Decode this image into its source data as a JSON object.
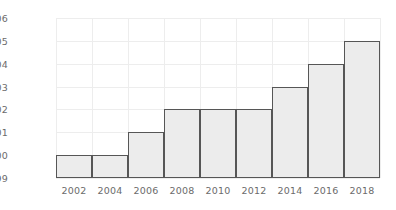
{
  "chart_data": {
    "type": "bar",
    "title": "",
    "subtitle": "",
    "xlabel": "",
    "ylabel": "",
    "categories": [
      "2002",
      "2004",
      "2006",
      "2008",
      "2010",
      "2012",
      "2014",
      "2016",
      "2018"
    ],
    "values": [
      10000,
      10000,
      10001,
      10002,
      10002,
      10002,
      10003,
      10004,
      10005
    ],
    "series": [
      {
        "name": "",
        "values": [
          10000,
          10000,
          10001,
          10002,
          10002,
          10002,
          10003,
          10004,
          10005
        ]
      }
    ],
    "ylim": [
      9999,
      10006
    ],
    "y_ticks": [
      9999,
      10000,
      10001,
      10002,
      10003,
      10004,
      10005,
      10006
    ],
    "y_tick_labels": [
      "9999",
      "10000",
      "10001",
      "10002",
      "10003",
      "10004",
      "10005",
      "10006"
    ],
    "x_tick_labels": [
      "2002",
      "2004",
      "2006",
      "2008",
      "2010",
      "2012",
      "2014",
      "2016",
      "2018"
    ],
    "baseline": 9999,
    "grid": true,
    "grid_axis": "both",
    "legend": false,
    "legend_position": "none",
    "annotations": [],
    "bar_gap": 0,
    "colors": {
      "bar_fill": "#ececec",
      "bar_edge": "#565656",
      "gridline": "#ededed",
      "tick_text": "#6b6b6b",
      "background": "#ffffff"
    }
  }
}
